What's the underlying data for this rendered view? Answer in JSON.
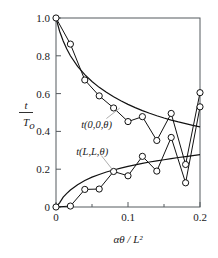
{
  "chart_data": {
    "type": "line",
    "title": "",
    "subtitle": "",
    "xlabel": "αθ / L²",
    "ylabel": "t / T_o",
    "xlim": [
      0,
      0.2
    ],
    "ylim": [
      0,
      1.0
    ],
    "grid": false,
    "legend_position": "inline-annotations",
    "xticks": [
      0,
      0.1,
      0.2
    ],
    "xtick_labels": [
      "0",
      "0.1",
      "0.2"
    ],
    "xminor_ticks": [
      0.05,
      0.15
    ],
    "yticks": [
      0,
      0.2,
      0.4,
      0.6,
      0.8,
      1.0
    ],
    "ytick_labels": [
      "0",
      "0.2",
      "0.4",
      "0.6",
      "0.8",
      "1.0"
    ],
    "annotations": [
      {
        "text": "t(0,0,θ)",
        "x": 0.035,
        "y": 0.44
      },
      {
        "text": "t(L,L,θ)",
        "x": 0.028,
        "y": 0.295
      }
    ],
    "series": [
      {
        "name": "t(0,0,θ) analytical",
        "style": "smooth-curve",
        "marker": "none",
        "x": [
          0.0,
          0.005,
          0.01,
          0.015,
          0.02,
          0.03,
          0.04,
          0.05,
          0.06,
          0.07,
          0.08,
          0.09,
          0.1,
          0.11,
          0.12,
          0.13,
          0.14,
          0.15,
          0.16,
          0.17,
          0.18,
          0.19,
          0.2
        ],
        "y": [
          1.0,
          0.93,
          0.878,
          0.836,
          0.8,
          0.744,
          0.7,
          0.664,
          0.633,
          0.607,
          0.583,
          0.562,
          0.543,
          0.526,
          0.51,
          0.496,
          0.483,
          0.471,
          0.46,
          0.45,
          0.441,
          0.432,
          0.424
        ]
      },
      {
        "name": "t(0,0,θ) numerical",
        "style": "polyline-markers",
        "marker": "open-circle",
        "x": [
          0.0,
          0.02,
          0.04,
          0.06,
          0.08,
          0.1,
          0.12,
          0.14,
          0.16,
          0.18,
          0.2
        ],
        "y": [
          1.0,
          0.862,
          0.672,
          0.588,
          0.524,
          0.452,
          0.478,
          0.352,
          0.495,
          0.225,
          0.605
        ]
      },
      {
        "name": "t(L,L,θ) analytical",
        "style": "smooth-curve",
        "marker": "none",
        "x": [
          0.0,
          0.005,
          0.01,
          0.015,
          0.02,
          0.03,
          0.04,
          0.05,
          0.06,
          0.07,
          0.08,
          0.09,
          0.1,
          0.11,
          0.12,
          0.13,
          0.14,
          0.15,
          0.16,
          0.17,
          0.18,
          0.19,
          0.2
        ],
        "y": [
          0.0,
          0.022,
          0.052,
          0.072,
          0.09,
          0.118,
          0.14,
          0.158,
          0.172,
          0.185,
          0.196,
          0.206,
          0.215,
          0.223,
          0.231,
          0.238,
          0.244,
          0.25,
          0.256,
          0.262,
          0.267,
          0.272,
          0.277
        ]
      },
      {
        "name": "t(L,L,θ) numerical",
        "style": "polyline-markers",
        "marker": "open-circle",
        "x": [
          0.0,
          0.02,
          0.04,
          0.06,
          0.08,
          0.1,
          0.12,
          0.14,
          0.16,
          0.18,
          0.2
        ],
        "y": [
          0.0,
          0.005,
          0.093,
          0.095,
          0.188,
          0.165,
          0.268,
          0.19,
          0.368,
          0.128,
          0.53
        ]
      }
    ]
  }
}
